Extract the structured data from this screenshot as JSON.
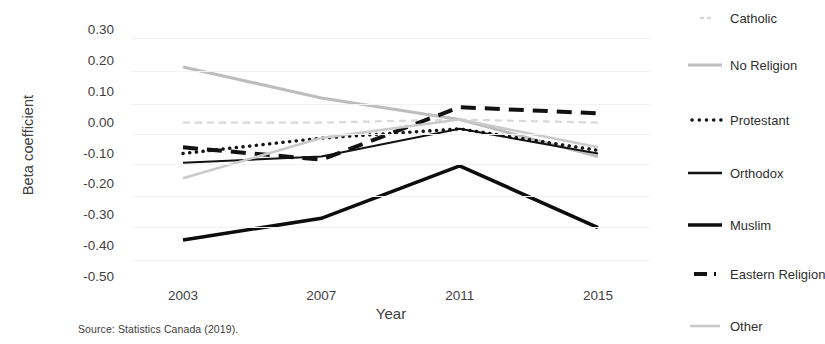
{
  "figure": {
    "y_axis_title": "Beta coefficient",
    "x_axis_title": "Year",
    "source_note": "Source: Statistics Canada (2019)."
  },
  "legend": {
    "items": [
      {
        "label": "Catholic",
        "marker": "short-dash-lightgray-line-icon"
      },
      {
        "label": "No Religion",
        "marker": "solid-gray-line-icon"
      },
      {
        "label": "Protestant",
        "marker": "dotted-black-line-icon"
      },
      {
        "label": "Orthodox",
        "marker": "thin-solid-black-line-icon"
      },
      {
        "label": "Muslim",
        "marker": "thick-solid-black-line-icon"
      },
      {
        "label": "Eastern Religion",
        "marker": "thick-dashed-black-line-icon"
      },
      {
        "label": "Other",
        "marker": "solid-lightgray-line-icon"
      }
    ]
  },
  "chart_data": {
    "type": "line",
    "title": "",
    "subtitle": "",
    "xlabel": "Year",
    "ylabel": "Beta coefficient",
    "categories": [
      "2003",
      "2007",
      "2011",
      "2015"
    ],
    "x": [
      2003,
      2007,
      2011,
      2015
    ],
    "xlim": [
      2003,
      2015
    ],
    "ylim": [
      -0.5,
      0.3
    ],
    "yticks": [
      "0.30",
      "0.20",
      "0.10",
      "0.00",
      "-0.10",
      "-0.20",
      "-0.30",
      "-0.40",
      "-0.50"
    ],
    "ytick_values": [
      0.3,
      0.2,
      0.1,
      0.0,
      -0.1,
      -0.2,
      -0.3,
      -0.4,
      -0.5
    ],
    "grid": false,
    "legend_position": "right",
    "annotations": [
      "Source: Statistics Canada (2019)."
    ],
    "series": [
      {
        "name": "Catholic",
        "values": [
          0.0,
          0.0,
          0.01,
          0.0
        ],
        "color": "#d8d8d8",
        "style": "dashed",
        "width": 2.2,
        "dash": "7,5"
      },
      {
        "name": "No Religion",
        "values": [
          0.18,
          0.08,
          0.01,
          -0.11
        ],
        "color": "#bdbdbd",
        "style": "solid",
        "width": 3.0,
        "dash": ""
      },
      {
        "name": "Protestant",
        "values": [
          -0.1,
          -0.05,
          -0.02,
          -0.09
        ],
        "color": "#141414",
        "style": "dotted",
        "width": 3.4,
        "dash": "0.2,6.5"
      },
      {
        "name": "Orthodox",
        "values": [
          -0.13,
          -0.11,
          -0.02,
          -0.1
        ],
        "color": "#111111",
        "style": "solid",
        "width": 2.0,
        "dash": ""
      },
      {
        "name": "Muslim",
        "values": [
          -0.38,
          -0.31,
          -0.14,
          -0.34
        ],
        "color": "#0d0d0d",
        "style": "solid",
        "width": 3.6,
        "dash": ""
      },
      {
        "name": "Eastern Religion",
        "values": [
          -0.08,
          -0.12,
          0.05,
          0.03
        ],
        "color": "#121212",
        "style": "dashed",
        "width": 4.0,
        "dash": "15,9"
      },
      {
        "name": "Other",
        "values": [
          -0.18,
          -0.05,
          0.01,
          -0.08
        ],
        "color": "#cacaca",
        "style": "solid",
        "width": 2.6,
        "dash": ""
      }
    ]
  }
}
